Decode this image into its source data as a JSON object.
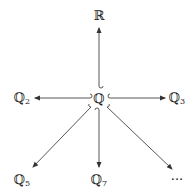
{
  "diagram": {
    "type": "inclusion-diagram",
    "center": {
      "id": "Q",
      "label": "ℚ",
      "x": 99,
      "y": 98
    },
    "nodes": [
      {
        "id": "R",
        "label": "ℝ",
        "sub": "",
        "x": 99,
        "y": 16
      },
      {
        "id": "Q2",
        "label": "ℚ",
        "sub": "2",
        "x": 22,
        "y": 98
      },
      {
        "id": "Q3",
        "label": "ℚ",
        "sub": "3",
        "x": 177,
        "y": 98
      },
      {
        "id": "Q5",
        "label": "ℚ",
        "sub": "5",
        "x": 22,
        "y": 180
      },
      {
        "id": "Q7",
        "label": "ℚ",
        "sub": "7",
        "x": 99,
        "y": 180
      },
      {
        "id": "more",
        "label": "···",
        "sub": "",
        "x": 177,
        "y": 180
      }
    ],
    "edges": [
      {
        "from": "Q",
        "to": "R",
        "style": "hook-arrow"
      },
      {
        "from": "Q",
        "to": "Q2",
        "style": "hook-arrow"
      },
      {
        "from": "Q",
        "to": "Q3",
        "style": "hook-arrow"
      },
      {
        "from": "Q",
        "to": "Q5",
        "style": "hook-arrow"
      },
      {
        "from": "Q",
        "to": "Q7",
        "style": "hook-arrow"
      },
      {
        "from": "Q",
        "to": "more",
        "style": "hook-arrow"
      }
    ],
    "colors": {
      "line": "#333333",
      "text": "#222222",
      "background": "#ffffff"
    }
  }
}
